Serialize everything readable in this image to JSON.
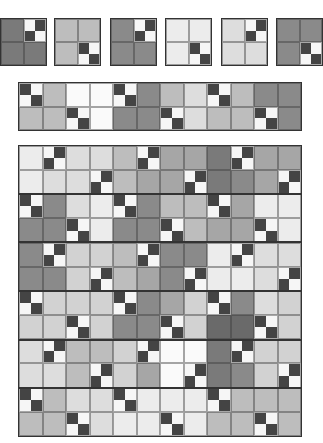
{
  "palette": {
    "L0": "#fafafa",
    "L1": "#ececec",
    "L2": "#dddddd",
    "L3": "#d2d2d2",
    "M1": "#bdbdbd",
    "M2": "#a6a6a6",
    "D1": "#7a7a7a",
    "D2": "#8a8a8a",
    "D3": "#6a6a6a",
    "dark": "#444444",
    "white": "#f6f6f6",
    "A": "fourpatch-white-topleft",
    "B": "fourpatch-dark-topleft"
  },
  "single_blocks": [
    {
      "x": 0,
      "y": 18,
      "w": 47,
      "h": 48,
      "cells": [
        [
          "D1",
          "A"
        ],
        [
          "D1",
          "D1"
        ]
      ]
    },
    {
      "x": 54,
      "y": 18,
      "w": 47,
      "h": 48,
      "cells": [
        [
          "M1",
          "M1"
        ],
        [
          "M1",
          "B"
        ]
      ]
    },
    {
      "x": 110,
      "y": 18,
      "w": 47,
      "h": 48,
      "cells": [
        [
          "D2",
          "A"
        ],
        [
          "D2",
          "D2"
        ]
      ]
    },
    {
      "x": 165,
      "y": 18,
      "w": 47,
      "h": 48,
      "cells": [
        [
          "L1",
          "L1"
        ],
        [
          "L1",
          "B"
        ]
      ]
    },
    {
      "x": 221,
      "y": 18,
      "w": 47,
      "h": 48,
      "cells": [
        [
          "L2",
          "A"
        ],
        [
          "L2",
          "L2"
        ]
      ]
    },
    {
      "x": 276,
      "y": 18,
      "w": 47,
      "h": 48,
      "cells": [
        [
          "D2",
          "D2"
        ],
        [
          "D2",
          "B"
        ]
      ]
    }
  ],
  "strip": {
    "x": 18,
    "y": 82,
    "w": 284,
    "h": 49,
    "rows": [
      [
        "B",
        "M1",
        "L0",
        "L0",
        "B",
        "D2",
        "M1",
        "L2",
        "B",
        "M1",
        "D2",
        "D2"
      ],
      [
        "M1",
        "M1",
        "B",
        "L0",
        "D2",
        "D2",
        "B",
        "L2",
        "M1",
        "M1",
        "B",
        "D2"
      ]
    ]
  },
  "quilt": {
    "x": 18,
    "y": 145,
    "w": 284,
    "h": 292,
    "rows": [
      [
        "L1",
        "A",
        "L2",
        "L2",
        "M1",
        "A",
        "M2",
        "M2",
        "D1",
        "A",
        "M2",
        "M2"
      ],
      [
        "L1",
        "L2",
        "L2",
        "A",
        "M1",
        "M2",
        "M2",
        "A",
        "D1",
        "D2",
        "M2",
        "A"
      ],
      [
        "B",
        "D2",
        "L2",
        "L1",
        "B",
        "D2",
        "M1",
        "M1",
        "B",
        "M2",
        "L1",
        "L1"
      ],
      [
        "D2",
        "D2",
        "B",
        "L1",
        "D2",
        "D2",
        "B",
        "M1",
        "M2",
        "M2",
        "B",
        "L1"
      ],
      [
        "D2",
        "A",
        "L3",
        "L3",
        "M1",
        "A",
        "D2",
        "D2",
        "L1",
        "A",
        "L2",
        "L2"
      ],
      [
        "D2",
        "D2",
        "L3",
        "A",
        "M1",
        "M2",
        "D2",
        "A",
        "L1",
        "L1",
        "L2",
        "A"
      ],
      [
        "B",
        "L3",
        "L3",
        "L3",
        "B",
        "D2",
        "M2",
        "L3",
        "B",
        "D2",
        "L2",
        "L3"
      ],
      [
        "L3",
        "L3",
        "B",
        "L3",
        "D2",
        "D2",
        "B",
        "L3",
        "D3",
        "D3",
        "B",
        "L3"
      ],
      [
        "L2",
        "A",
        "M1",
        "M1",
        "L3",
        "A",
        "L0",
        "L0",
        "D1",
        "A",
        "L3",
        "L3"
      ],
      [
        "L2",
        "L2",
        "M1",
        "A",
        "L3",
        "M2",
        "L0",
        "A",
        "D1",
        "D2",
        "L3",
        "A"
      ],
      [
        "B",
        "M1",
        "L2",
        "L2",
        "B",
        "L1",
        "L1",
        "L1",
        "B",
        "M1",
        "M1",
        "M1"
      ],
      [
        "M1",
        "M1",
        "B",
        "L2",
        "L1",
        "L1",
        "B",
        "L1",
        "M1",
        "M1",
        "B",
        "M1"
      ]
    ]
  }
}
